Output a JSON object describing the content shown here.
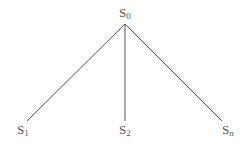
{
  "diagram": {
    "type": "tree",
    "root": {
      "id": "S0",
      "base": "S",
      "sub": "0"
    },
    "children": [
      {
        "id": "S1",
        "base": "S",
        "sub": "1"
      },
      {
        "id": "S2",
        "base": "S",
        "sub": "2"
      },
      {
        "id": "Sn",
        "base": "S",
        "sub": "n"
      }
    ],
    "edges": [
      [
        "S0",
        "S1"
      ],
      [
        "S0",
        "S2"
      ],
      [
        "S0",
        "Sn"
      ]
    ],
    "line_color": "#555555"
  }
}
